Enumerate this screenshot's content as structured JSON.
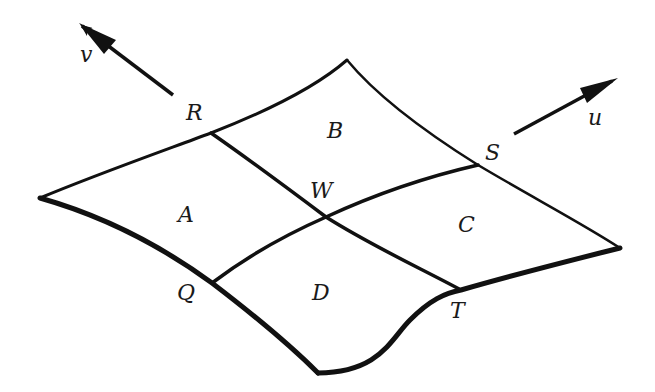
{
  "diagram": {
    "type": "curved surface patch subdivided into four sub-patches",
    "colors": {
      "background": "#ffffff",
      "stroke": "#111111",
      "text": "#1a1a1a"
    },
    "vectors": {
      "u": {
        "label": "u",
        "direction": "up-right"
      },
      "v": {
        "label": "v",
        "direction": "up-left"
      }
    },
    "points": {
      "R": "R",
      "S": "S",
      "W": "W",
      "Q": "Q",
      "T": "T"
    },
    "regions": {
      "A": "A",
      "B": "B",
      "C": "C",
      "D": "D"
    }
  }
}
